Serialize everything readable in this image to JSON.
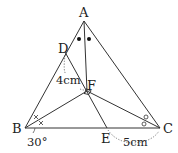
{
  "figure": {
    "type": "geometry-triangle",
    "stroke_color": "#333333",
    "background": "#ffffff"
  },
  "points": {
    "A": {
      "label": "A",
      "x": 84,
      "y": 21
    },
    "B": {
      "label": "B",
      "x": 25,
      "y": 128
    },
    "C": {
      "label": "C",
      "x": 160,
      "y": 128
    },
    "D": {
      "label": "D",
      "x": 65,
      "y": 52
    },
    "E": {
      "label": "E",
      "x": 107,
      "y": 128
    },
    "F": {
      "label": "F",
      "x": 87,
      "y": 91
    }
  },
  "segments": [
    "AB",
    "AC",
    "BC",
    "AF",
    "BF",
    "CF",
    "DE"
  ],
  "measurements": {
    "df_length": "4cm",
    "ec_length": "5cm",
    "angle_b": "30°"
  },
  "markings": {
    "angle_a_bisector": "two filled dots (●●)",
    "angle_b_bisector": "two crosses (××)",
    "angle_c_bisector": "two circles (○○)",
    "right_angle_at_f": "square mark"
  }
}
